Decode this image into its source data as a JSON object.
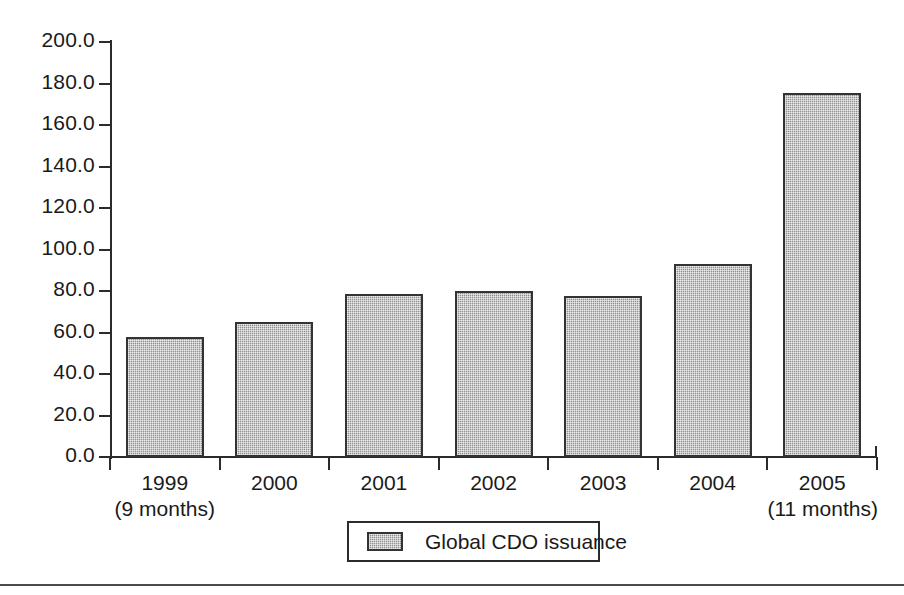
{
  "chart_data": {
    "type": "bar",
    "title": "",
    "subtitle": "",
    "xlabel": "",
    "ylabel": "",
    "ylim": [
      0,
      200
    ],
    "ytick_step": 20,
    "grid": false,
    "legend_position": "bottom-center",
    "categories": [
      "1999",
      "2000",
      "2001",
      "2002",
      "2003",
      "2004",
      "2005"
    ],
    "category_sublabels": [
      "(9 months)",
      "",
      "",
      "",
      "",
      "",
      "(11 months)"
    ],
    "ytick_labels": [
      "200.0",
      "180.0",
      "160.0",
      "140.0",
      "120.0",
      "100.0",
      "80.0",
      "60.0",
      "40.0",
      "20.0",
      "0.0"
    ],
    "ytick_values": [
      200,
      180,
      160,
      140,
      120,
      100,
      80,
      60,
      40,
      20,
      0
    ],
    "series": [
      {
        "name": "Global CDO issuance",
        "values": [
          57.8,
          65.2,
          78.5,
          79.8,
          77.5,
          93.0,
          175.2
        ],
        "color": "#8f8f8f",
        "edge_color": "#333333",
        "fill_pattern": "checker-dither"
      }
    ]
  },
  "legend": {
    "entries": [
      {
        "label": "Global CDO issuance",
        "swatch_color": "#8f8f8f"
      }
    ]
  },
  "axes": {
    "axis_color": "#2b2b2b"
  }
}
